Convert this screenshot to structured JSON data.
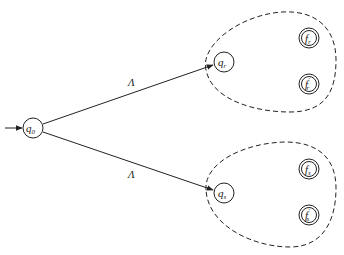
{
  "diagram": {
    "type": "nfa-construction",
    "start_state": {
      "id": "q0",
      "label": "q",
      "sub": "0"
    },
    "edges": [
      {
        "from": "q0",
        "to": "qr",
        "label": "Λ"
      },
      {
        "from": "q0",
        "to": "qs",
        "label": "Λ"
      }
    ],
    "groups": [
      {
        "id": "group-r",
        "start": {
          "id": "qr",
          "label": "q",
          "sub": "r"
        },
        "finals": [
          {
            "id": "fr",
            "label": "f",
            "sub": "r",
            "prime": ""
          },
          {
            "id": "fr-prime",
            "label": "f",
            "sub": "r",
            "prime": "′"
          }
        ]
      },
      {
        "id": "group-s",
        "start": {
          "id": "qs",
          "label": "q",
          "sub": "s"
        },
        "finals": [
          {
            "id": "fs",
            "label": "f",
            "sub": "s",
            "prime": ""
          },
          {
            "id": "fs-prime",
            "label": "f",
            "sub": "s",
            "prime": "′"
          }
        ]
      }
    ],
    "colors": {
      "stroke": "#222222",
      "background": "#ffffff"
    }
  }
}
